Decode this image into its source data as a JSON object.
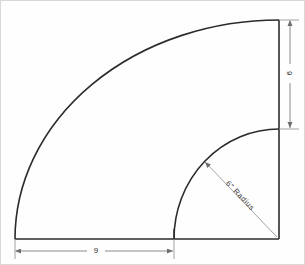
{
  "figure": {
    "background_color": "#fefefe",
    "line_color": "#2b2b2b",
    "dimension_line_color": "#6e6e6e",
    "border_color": "#d8d8d8"
  },
  "dimensions": {
    "vertical": {
      "label": "6",
      "orientation": "rotated-90",
      "position": "right-side",
      "from_y": 19,
      "to_y": 128
    },
    "horizontal": {
      "label": "9",
      "orientation": "horizontal",
      "position": "bottom",
      "from_x": 14,
      "to_x": 173
    }
  },
  "annotations": {
    "radius_leader": {
      "label": "6\" Radius",
      "points_to": "inner-arc",
      "origin": "bottom-right-corner"
    }
  },
  "geometry": {
    "center": {
      "x": 278,
      "y": 238
    },
    "outer_arc": {
      "name": "large-quarter-circle",
      "left_endpoint_x": 14,
      "top_endpoint_y": 19
    },
    "inner_arc": {
      "name": "small-quarter-circle",
      "left_endpoint_x": 173,
      "top_endpoint_y": 128
    },
    "baseline_y": 238,
    "right_edge_x": 278
  }
}
